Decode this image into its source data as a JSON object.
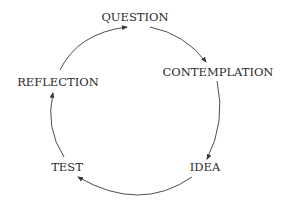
{
  "diagram": {
    "type": "cycle",
    "nodes": [
      {
        "id": "question",
        "label": "QUESTION"
      },
      {
        "id": "contemplation",
        "label": "CONTEMPLATION"
      },
      {
        "id": "idea",
        "label": "IDEA"
      },
      {
        "id": "test",
        "label": "TEST"
      },
      {
        "id": "reflection",
        "label": "REFLECTION"
      }
    ],
    "edges": [
      {
        "from": "question",
        "to": "contemplation"
      },
      {
        "from": "contemplation",
        "to": "idea"
      },
      {
        "from": "idea",
        "to": "test"
      },
      {
        "from": "test",
        "to": "reflection"
      },
      {
        "from": "reflection",
        "to": "question"
      }
    ],
    "colors": {
      "text": "#2b2b2b",
      "arrow": "#3a3a3a",
      "background": "#ffffff"
    }
  }
}
